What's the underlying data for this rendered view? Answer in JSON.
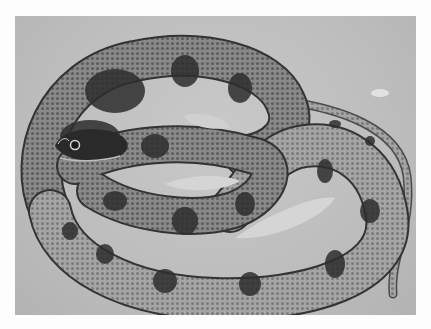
{
  "image": {
    "subject": "coiled banded water snake",
    "style": "black-and-white photograph",
    "background_color": "#c0c0c0",
    "border_color": "#fdfdfd"
  }
}
